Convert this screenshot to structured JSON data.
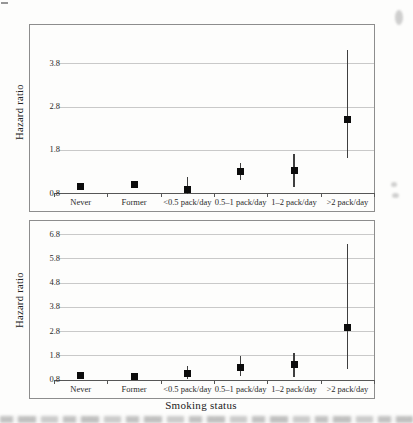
{
  "figure": {
    "xlabel": "Smoking status",
    "ylabel": "Hazard ratio"
  },
  "chart_data": [
    {
      "type": "scatter",
      "panel": "top",
      "title": "",
      "ylabel": "Hazard ratio",
      "xlabel": "",
      "categories": [
        "Never",
        "Former",
        "<0.5 pack/day",
        "0.5–1 pack/day",
        "1–2 pack/day",
        ">2 pack/day"
      ],
      "series": [
        {
          "name": "Hazard ratio (point estimate with CI)",
          "values": [
            0.95,
            1.0,
            0.88,
            1.3,
            1.33,
            2.5
          ],
          "ci_low": [
            null,
            null,
            0.77,
            1.1,
            0.93,
            1.6
          ],
          "ci_high": [
            null,
            null,
            1.17,
            1.5,
            1.7,
            4.1
          ]
        }
      ],
      "yticks": [
        0.8,
        1.8,
        2.8,
        3.8
      ],
      "ylim": [
        0.8,
        4.69
      ],
      "grid": true,
      "legend": false,
      "marker": "black-square"
    },
    {
      "type": "scatter",
      "panel": "bottom",
      "title": "",
      "ylabel": "Hazard ratio",
      "xlabel": "Smoking status",
      "categories": [
        "Never",
        "Former",
        "<0.5 pack/day",
        "0.5–1 pack/day",
        "1–2 pack/day",
        ">2 pack/day"
      ],
      "series": [
        {
          "name": "Hazard ratio (point estimate with CI)",
          "values": [
            0.95,
            0.93,
            1.05,
            1.3,
            1.4,
            2.95
          ],
          "ci_low": [
            null,
            null,
            0.8,
            0.95,
            0.92,
            1.25
          ],
          "ci_high": [
            null,
            null,
            1.35,
            1.75,
            1.9,
            6.4
          ]
        }
      ],
      "yticks": [
        0.8,
        1.8,
        2.8,
        3.8,
        4.8,
        5.8,
        6.8
      ],
      "ylim": [
        0.8,
        7.34
      ],
      "grid": true,
      "legend": false,
      "marker": "black-square"
    }
  ],
  "artifacts": {
    "bottom_caption": "illegible cropped caption text",
    "edge_marks": "faint scan smudges"
  }
}
